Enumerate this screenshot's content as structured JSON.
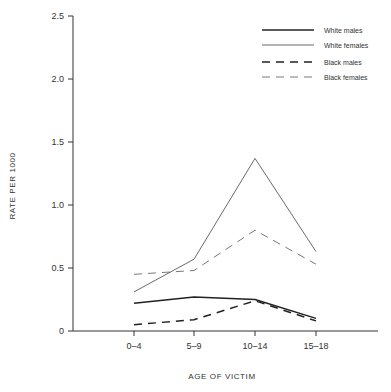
{
  "chart_data": {
    "type": "line",
    "title": "",
    "xlabel": "AGE OF VICTIM",
    "ylabel": "RATE PER 1000",
    "categories": [
      "0–4",
      "5–9",
      "10–14",
      "15–18"
    ],
    "ylim": [
      0,
      2.5
    ],
    "yticks": [
      0,
      0.5,
      1.0,
      1.5,
      2.0,
      2.5
    ],
    "ytick_labels": [
      "0",
      "0.5",
      "1.0",
      "1.5",
      "2.0",
      "2.5"
    ],
    "grid": false,
    "legend_position": "upper right",
    "series": [
      {
        "name": "White males",
        "values": [
          0.22,
          0.27,
          0.25,
          0.1
        ],
        "style": "solid-thick",
        "color": "#222222"
      },
      {
        "name": "White females",
        "values": [
          0.31,
          0.57,
          1.37,
          0.63
        ],
        "style": "solid-thin",
        "color": "#444444"
      },
      {
        "name": "Black males",
        "values": [
          0.05,
          0.09,
          0.24,
          0.08
        ],
        "style": "dashed-thick",
        "color": "#222222"
      },
      {
        "name": "Black females",
        "values": [
          0.45,
          0.48,
          0.8,
          0.53
        ],
        "style": "dashed-thin",
        "color": "#555555"
      }
    ]
  }
}
